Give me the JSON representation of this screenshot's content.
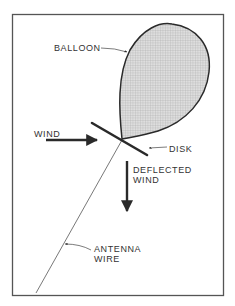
{
  "figure": {
    "labels": {
      "balloon": "BALLOON",
      "wind": "WIND",
      "disk": "DISK",
      "deflected_line1": "DEFLECTED",
      "deflected_line2": "WIND",
      "antenna_line1": "ANTENNA",
      "antenna_line2": "WIRE"
    },
    "colors": {
      "stroke": "#2a2a2a",
      "frame": "#555555",
      "balloon_fill": "#d9d9d9",
      "hatch": "#b5b5b5",
      "text": "#333333"
    }
  }
}
